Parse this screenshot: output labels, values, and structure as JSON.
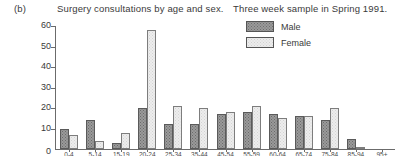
{
  "caption": {
    "part_label": "(b)",
    "title": "Surgery consultations by age and sex.",
    "subtitle": "Three week sample in Spring 1991."
  },
  "legend": {
    "position": "top-right",
    "entries": [
      {
        "label": "Male",
        "swatch": "male-swatch",
        "color": "#9a9a9a"
      },
      {
        "label": "Female",
        "swatch": "female-swatch",
        "color": "#ededed"
      }
    ]
  },
  "axes": {
    "y_ticks": [
      "0",
      "10",
      "20",
      "30",
      "40",
      "50",
      "60"
    ],
    "zero_label": "0"
  },
  "chart_data": {
    "type": "bar",
    "title": "Surgery consultations by age and sex.",
    "subtitle": "Three week sample in Spring 1991.",
    "xlabel": "",
    "ylabel": "",
    "ylim": [
      0,
      60
    ],
    "yticks": [
      0,
      10,
      20,
      30,
      40,
      50,
      60
    ],
    "grid": false,
    "legend_position": "top-right",
    "categories": [
      "0-4",
      "5-14",
      "15-19",
      "20-24",
      "25-34",
      "35-44",
      "45-54",
      "55-59",
      "60-64",
      "65-74",
      "75-84",
      "85-94",
      "95+"
    ],
    "series": [
      {
        "name": "Male",
        "values": [
          10,
          14,
          3,
          20,
          12,
          12,
          17,
          18,
          17,
          16,
          14,
          5,
          0
        ]
      },
      {
        "name": "Female",
        "values": [
          7,
          4,
          8,
          58,
          21,
          20,
          18,
          21,
          15,
          16,
          20,
          1,
          0
        ]
      }
    ]
  }
}
